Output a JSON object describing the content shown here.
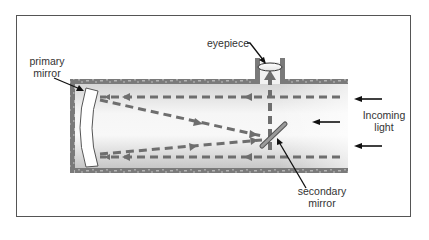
{
  "diagram": {
    "labels": {
      "primary_mirror_line1": "primary",
      "primary_mirror_line2": "mirror",
      "eyepiece": "eyepiece",
      "incoming_light_line1": "Incoming",
      "incoming_light_line2": "light",
      "secondary_mirror_line1": "secondary",
      "secondary_mirror_line2": "mirror"
    },
    "colors": {
      "tube_wall": "#7a7a7a",
      "tube_wall_speckle": "#b0b0b0",
      "light_path": "#6e6e6e",
      "pointer_arrow": "#111111",
      "frame_border": "#555555",
      "mirror_fill": "#ffffff",
      "secondary_mirror": "#8a8a8a"
    },
    "components": [
      {
        "name": "tube",
        "description": "telescope tube"
      },
      {
        "name": "primary-mirror",
        "description": "curved mirror at closed end"
      },
      {
        "name": "secondary-mirror",
        "description": "flat diagonal mirror"
      },
      {
        "name": "eyepiece",
        "description": "lens at top opening"
      }
    ]
  }
}
